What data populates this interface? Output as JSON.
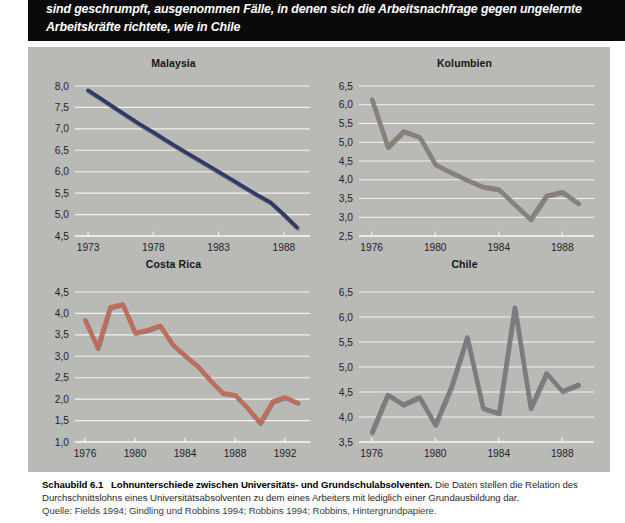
{
  "banner": {
    "line1": "sind geschrumpft, ausgenommen Fälle, in denen sich die Arbeitsnachfrage gegen ungelernte",
    "line2": "Arbeitskräfte richtete, wie in Chile"
  },
  "caption": {
    "figure_number": "Schaubild 6.1",
    "title": "Lohnunterschiede zwischen Universitäts- und Grundschulabsolventen.",
    "description": "Die Daten stellen die Relation des Durchschnittslohns eines Universitätsabsolventen zu dem eines Arbeiters mit lediglich einer Grundausbildung dar.",
    "source": "Quelle: Fields 1994; Gindling und Robbins 1994; Robbins 1994; Robbins, Hintergrundpapiere."
  },
  "colors": {
    "panel_background": "#b9b9b6",
    "banner_background": "#0a0a0a",
    "gridline": "#f2f2ef",
    "malaysia_line": "#2d3a6b",
    "kolumbien_line": "#8a8078",
    "costarica_line": "#c86a56",
    "chile_line": "#7a7d80"
  },
  "chart_data": [
    {
      "type": "line",
      "title": "Malaysia",
      "xlabel": "",
      "ylabel": "",
      "grid": true,
      "legend": "none",
      "color": "#2d3a6b",
      "xlim": [
        1972,
        1990
      ],
      "ylim": [
        4.5,
        8.0
      ],
      "ytick_labels": [
        "8,0",
        "7,5",
        "7,0",
        "6,5",
        "6,0",
        "5,5",
        "5,0",
        "4,5"
      ],
      "yticks": [
        8.0,
        7.5,
        7.0,
        6.5,
        6.0,
        5.5,
        5.0,
        4.5
      ],
      "xtick_labels": [
        "1973",
        "1978",
        "1983",
        "1988"
      ],
      "xticks": [
        1973,
        1978,
        1983,
        1988
      ],
      "x": [
        1973,
        1974,
        1975,
        1976,
        1977,
        1978,
        1979,
        1980,
        1981,
        1982,
        1983,
        1984,
        1985,
        1986,
        1987,
        1988,
        1989
      ],
      "values": [
        7.9,
        7.7,
        7.5,
        7.3,
        7.1,
        6.92,
        6.73,
        6.54,
        6.36,
        6.18,
        6.0,
        5.82,
        5.63,
        5.45,
        5.28,
        5.0,
        4.7
      ]
    },
    {
      "type": "line",
      "title": "Kolumbien",
      "xlabel": "",
      "ylabel": "",
      "grid": true,
      "legend": "none",
      "color": "#8a8078",
      "xlim": [
        1975.2,
        1990
      ],
      "ylim": [
        2.5,
        6.5
      ],
      "ytick_labels": [
        "6,5",
        "6,0",
        "5,5",
        "5,0",
        "4,5",
        "4,0",
        "3,5",
        "3,0",
        "2,5"
      ],
      "yticks": [
        6.5,
        6.0,
        5.5,
        5.0,
        4.5,
        4.0,
        3.5,
        3.0,
        2.5
      ],
      "xtick_labels": [
        "1976",
        "1980",
        "1984",
        "1988"
      ],
      "xticks": [
        1976,
        1980,
        1984,
        1988
      ],
      "x": [
        1976,
        1977,
        1978,
        1979,
        1980,
        1981,
        1982,
        1983,
        1984,
        1985,
        1986,
        1987,
        1988,
        1989
      ],
      "values": [
        6.15,
        4.88,
        5.3,
        5.15,
        4.42,
        4.2,
        4.0,
        3.82,
        3.75,
        3.35,
        2.95,
        3.58,
        3.68,
        3.38
      ]
    },
    {
      "type": "line",
      "title": "Costa Rica",
      "xlabel": "",
      "ylabel": "",
      "grid": true,
      "legend": "none",
      "color": "#c86a56",
      "xlim": [
        1975.2,
        1994
      ],
      "ylim": [
        1.0,
        4.5
      ],
      "ytick_labels": [
        "4,5",
        "4,0",
        "3,5",
        "3,0",
        "2,5",
        "2,0",
        "1,5",
        "1,0"
      ],
      "yticks": [
        4.5,
        4.0,
        3.5,
        3.0,
        2.5,
        2.0,
        1.5,
        1.0
      ],
      "xtick_labels": [
        "1976",
        "1980",
        "1984",
        "1988",
        "1992"
      ],
      "xticks": [
        1976,
        1980,
        1984,
        1988,
        1992
      ],
      "x": [
        1976,
        1977,
        1978,
        1979,
        1980,
        1981,
        1982,
        1983,
        1984,
        1985,
        1986,
        1987,
        1988,
        1989,
        1990,
        1991,
        1992,
        1993
      ],
      "values": [
        3.85,
        3.2,
        4.15,
        4.22,
        3.55,
        3.62,
        3.72,
        3.28,
        3.02,
        2.78,
        2.45,
        2.15,
        2.1,
        1.8,
        1.45,
        1.95,
        2.05,
        1.92
      ]
    },
    {
      "type": "line",
      "title": "Chile",
      "xlabel": "",
      "ylabel": "",
      "grid": true,
      "legend": "none",
      "color": "#7a7d80",
      "xlim": [
        1975.2,
        1990
      ],
      "ylim": [
        3.5,
        6.5
      ],
      "ytick_labels": [
        "6,5",
        "6,0",
        "5,5",
        "5,0",
        "4,5",
        "4,0",
        "3,5"
      ],
      "yticks": [
        6.5,
        6.0,
        5.5,
        5.0,
        4.5,
        4.0,
        3.5
      ],
      "xtick_labels": [
        "1976",
        "1980",
        "1984",
        "1988"
      ],
      "xticks": [
        1976,
        1980,
        1984,
        1988
      ],
      "x": [
        1976,
        1977,
        1978,
        1979,
        1980,
        1981,
        1982,
        1983,
        1984,
        1985,
        1986,
        1987,
        1988,
        1989
      ],
      "values": [
        3.7,
        4.45,
        4.25,
        4.4,
        3.85,
        4.6,
        5.6,
        4.18,
        4.08,
        6.2,
        4.18,
        4.88,
        4.52,
        4.65
      ]
    }
  ]
}
